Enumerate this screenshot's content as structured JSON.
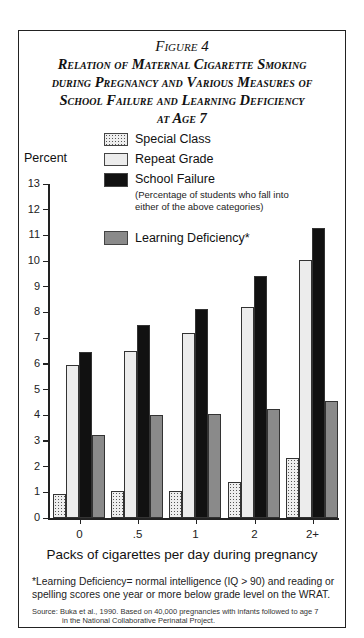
{
  "figure": {
    "label": "Figure 4",
    "title": "Relation of Maternal Cigarette Smoking during Pregnancy and Various Measures of School Failure and Learning Deficiency at Age 7",
    "title_lines": [
      "Relation of Maternal Cigarette Smoking",
      "during Pregnancy and Various Measures of",
      "School Failure and Learning Deficiency",
      "at Age 7"
    ]
  },
  "legend": {
    "items": [
      {
        "label": "Special Class",
        "pattern": "dotted"
      },
      {
        "label": "Repeat Grade",
        "pattern": "light-gray"
      },
      {
        "label": "School Failure",
        "pattern": "black"
      },
      {
        "label": "Learning Deficiency*",
        "pattern": "medium-gray"
      }
    ],
    "school_failure_note": "(Percentage of students who fall into either of the above categories)"
  },
  "axes": {
    "ylabel": "Percent",
    "xlabel": "Packs of cigarettes per day during pregnancy",
    "yticks": [
      "0",
      "1",
      "2",
      "3",
      "4",
      "5",
      "6",
      "7",
      "8",
      "9",
      "10",
      "11",
      "12",
      "13"
    ],
    "xticks": [
      "0",
      ".5",
      "1",
      "2",
      "2+"
    ]
  },
  "footnote": "*Learning Deficiency= normal intelligence (IQ > 90) and reading or spelling scores one year or more below grade level on the WRAT.",
  "source": {
    "line1": "Source: Buka et al., 1990. Based on 40,000 pregnancies with infants followed to age 7",
    "line2": "in the National Collaborative Perinatal Project."
  },
  "chart_data": {
    "type": "bar",
    "xlabel": "Packs of cigarettes per day during pregnancy",
    "ylabel": "Percent",
    "ylim": [
      0,
      13
    ],
    "grid": false,
    "legend_position": "top",
    "categories": [
      "0",
      ".5",
      "1",
      "2",
      "2+"
    ],
    "series": [
      {
        "name": "Special Class",
        "values": [
          0.95,
          1.05,
          1.05,
          1.4,
          2.35
        ]
      },
      {
        "name": "Repeat Grade",
        "values": [
          5.95,
          6.5,
          7.2,
          8.2,
          10.05
        ]
      },
      {
        "name": "School Failure",
        "values": [
          6.45,
          7.5,
          8.15,
          9.4,
          11.3
        ]
      },
      {
        "name": "Learning Deficiency*",
        "values": [
          3.25,
          4.0,
          4.05,
          4.25,
          4.55
        ]
      }
    ],
    "annotations": [
      "School Failure: (Percentage of students who fall into either of the above categories)",
      "*Learning Deficiency= normal intelligence (IQ > 90) and reading or spelling scores one year or more below grade level on the WRAT.",
      "Source: Buka et al., 1990. Based on 40,000 pregnancies with infants followed to age 7 in the National Collaborative Perinatal Project."
    ]
  }
}
